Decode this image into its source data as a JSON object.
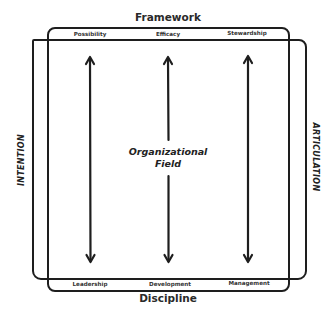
{
  "diagram": {
    "top_title": "Framework",
    "bottom_title": "Discipline",
    "left_label": "INTENTION",
    "right_label": "ARTICULATION",
    "center_label_line1": "Organizational",
    "center_label_line2": "Field",
    "top_items": [
      "Possibility",
      "Efficacy",
      "Stewardship"
    ],
    "bottom_items": [
      "Leadership",
      "Development",
      "Management"
    ],
    "arrows": [
      {
        "name": "left-arrow",
        "x": 90
      },
      {
        "name": "center-arrow",
        "x": 168
      },
      {
        "name": "right-arrow",
        "x": 248
      }
    ],
    "colors": {
      "stroke": "#1e1e1e",
      "background": "#ffffff"
    }
  }
}
